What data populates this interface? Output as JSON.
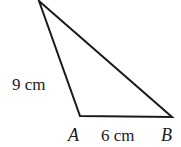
{
  "figure": {
    "type": "triangle",
    "vertices": {
      "top": {
        "label": "",
        "x": 39,
        "y": 1
      },
      "A": {
        "label": "A",
        "x": 80,
        "y": 116
      },
      "B": {
        "label": "B",
        "x": 172,
        "y": 117
      }
    },
    "side_labels": {
      "top_A": "9 cm",
      "A_B": "6 cm"
    },
    "colors": {
      "stroke": "#1a1a1a",
      "background": "#ffffff"
    }
  }
}
